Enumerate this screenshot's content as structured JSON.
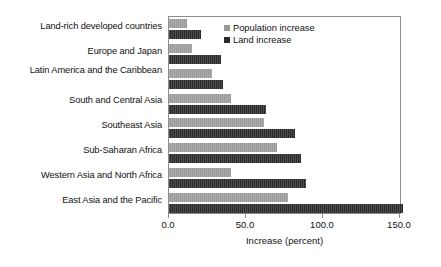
{
  "chart_data": {
    "type": "bar",
    "orientation": "horizontal",
    "title": "",
    "xlabel": "Increase (percent)",
    "ylabel": "",
    "xlim": [
      0.0,
      150.0
    ],
    "xticks": [
      0.0,
      50.0,
      100.0,
      150.0
    ],
    "xtick_labels": [
      "0.0",
      "50.0",
      "100.0",
      "150.0"
    ],
    "grid": false,
    "legend_position": "top-right",
    "categories": [
      "Land-rich developed countries",
      "Europe and Japan",
      "Latin America and the Caribbean",
      "South and Central Asia",
      "Southeast Asia",
      "Sub-Saharan Africa",
      "Western Asia and North Africa",
      "East Asia and the Pacific"
    ],
    "series": [
      {
        "name": "Population increase",
        "color": "#9a9a9a",
        "values": [
          12,
          15,
          28,
          40,
          62,
          70,
          40,
          77
        ]
      },
      {
        "name": "Land increase",
        "color": "#2b2b2b",
        "values": [
          21,
          34,
          35,
          63,
          82,
          86,
          89,
          152
        ]
      }
    ]
  },
  "legend": {
    "items": [
      {
        "label": "Population increase",
        "swatch": "pop"
      },
      {
        "label": "Land increase",
        "swatch": "land"
      }
    ]
  },
  "axis": {
    "x_title": "Increase (percent)"
  }
}
